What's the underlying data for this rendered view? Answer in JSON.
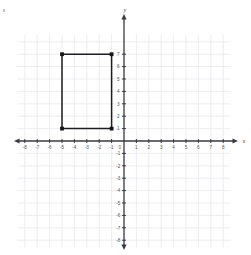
{
  "chart_data": {
    "type": "scatter",
    "title": "",
    "xlabel": "x",
    "ylabel": "y",
    "xlim": [
      -8.6,
      8.6
    ],
    "ylim": [
      -8.6,
      8.6
    ],
    "grid": true,
    "grid_step": 1,
    "legend": "none",
    "x_ticks": [
      -8,
      -7,
      -6,
      -5,
      -4,
      -3,
      -2,
      -1,
      0,
      1,
      2,
      3,
      4,
      5,
      6,
      7,
      8
    ],
    "y_ticks": [
      -8,
      -7,
      -6,
      -5,
      -4,
      -3,
      -2,
      -1,
      1,
      2,
      3,
      4,
      5,
      6,
      7
    ],
    "x_tick_labels": [
      "-8",
      "-7",
      "-6",
      "-5",
      "-4",
      "-3",
      "-2",
      "-1",
      "0",
      "1",
      "2",
      "3",
      "4",
      "5",
      "6",
      "7",
      "8"
    ],
    "y_tick_labels": [
      "-8",
      "-7",
      "-6",
      "-5",
      "-4",
      "-3",
      "-2",
      "-1",
      "1",
      "2",
      "3",
      "4",
      "5",
      "6",
      "7"
    ],
    "origin_label": "0",
    "series": [
      {
        "name": "rectangle",
        "shape": "rectangle",
        "closed": true,
        "stroke": "#1c1c22",
        "vertices": [
          {
            "x": -5,
            "y": 7
          },
          {
            "x": -1,
            "y": 7
          },
          {
            "x": -1,
            "y": 1
          },
          {
            "x": -5,
            "y": 1
          }
        ],
        "width": 4,
        "height": 6
      }
    ]
  },
  "axes": {
    "x_axis_label": "x",
    "y_axis_label": "y",
    "axis_color": "#3b3b44",
    "grid_color": "#e8e8ec"
  }
}
